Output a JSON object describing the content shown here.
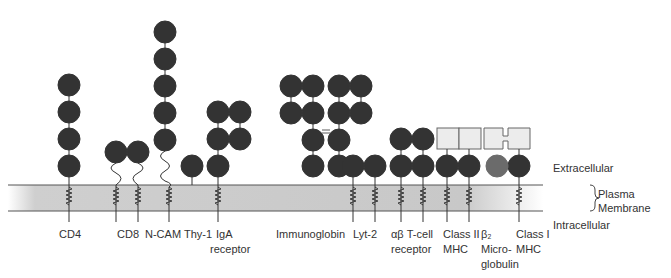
{
  "diagram": {
    "colors": {
      "domain_dark": "#333333",
      "beta2_microglobulin": "#6b6b6b",
      "mhc_box": "#ececec",
      "membrane": "#c8c8c8",
      "membrane_line": "#555555"
    },
    "regions": {
      "extracellular": "Extracellular",
      "plasma_membrane_line1": "Plasma",
      "plasma_membrane_line2": "Membrane",
      "intracellular": "Intracellular"
    },
    "proteins": [
      {
        "id": "cd4",
        "label_line1": "CD4",
        "label_line2": ""
      },
      {
        "id": "cd8",
        "label_line1": "CD8",
        "label_line2": ""
      },
      {
        "id": "ncam",
        "label_line1": "N-CAM",
        "label_line2": ""
      },
      {
        "id": "thy1",
        "label_line1": "Thy-1",
        "label_line2": ""
      },
      {
        "id": "iga",
        "label_line1": "IgA",
        "label_line2": "receptor"
      },
      {
        "id": "immunoglobin",
        "label_line1": "Immunoglobin",
        "label_line2": ""
      },
      {
        "id": "lyt2",
        "label_line1": "Lyt-2",
        "label_line2": ""
      },
      {
        "id": "tcr",
        "label_line1": "αβ T-cell",
        "label_line2": "receptor"
      },
      {
        "id": "mhc2",
        "label_line1": "Class II",
        "label_line2": "MHC"
      },
      {
        "id": "b2m",
        "label_line1": "β₂",
        "label_line2": "Micro-",
        "label_line3": "globulin"
      },
      {
        "id": "mhc1",
        "label_line1": "Class I",
        "label_line2": "MHC"
      }
    ]
  }
}
